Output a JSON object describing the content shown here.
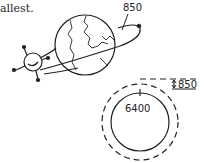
{
  "caption": {
    "text": "allest."
  },
  "figure_top": {
    "orbit_height_label": "850",
    "description": "Satellite orbiting Earth at 850 km altitude"
  },
  "figure_bottom": {
    "earth_radius_label": "6400",
    "altitude_label": "850"
  },
  "colors": {
    "line": "#222222",
    "background": "#ffffff"
  }
}
